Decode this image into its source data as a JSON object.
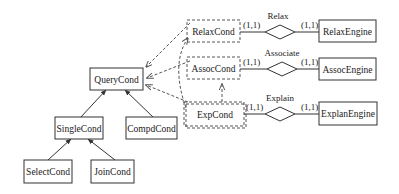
{
  "diagram": {
    "type": "class / ER diagram",
    "entities": {
      "querycond": "QueryCond",
      "singlecond": "SingleCond",
      "compdcond": "CompdCond",
      "selectcond": "SelectCond",
      "joincond": "JoinCond",
      "relaxcond": "RelaxCond",
      "assoccond": "AssocCond",
      "expcond": "ExpCond",
      "relaxengine": "RelaxEngine",
      "assocengine": "AssocEngine",
      "explanengine": "ExplanEngine"
    },
    "relationships": {
      "relax": "Relax",
      "associate": "Associate",
      "explain": "Explain"
    },
    "cardinalities": {
      "relax_left": "(1,1)",
      "relax_right": "(1,1)",
      "associate_left": "(1,1)",
      "associate_right": "(1,1)",
      "explain_left": "(1,1)",
      "explain_right": "(1,1)"
    },
    "colors": {
      "line": "#333333",
      "dashed": "#555555",
      "background": "#ffffff"
    }
  }
}
